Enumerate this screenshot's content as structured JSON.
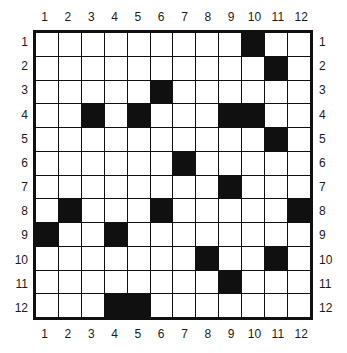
{
  "puzzle": {
    "type": "grid-puzzle",
    "rows": 12,
    "cols": 12,
    "column_labels": [
      "1",
      "2",
      "3",
      "4",
      "5",
      "6",
      "7",
      "8",
      "9",
      "10",
      "11",
      "12"
    ],
    "row_labels": [
      "1",
      "2",
      "3",
      "4",
      "5",
      "6",
      "7",
      "8",
      "9",
      "10",
      "11",
      "12"
    ],
    "colors": {
      "filled": "#101010",
      "empty": "#ffffff",
      "grid_line": "#101010",
      "label_text": "#1b1b1b"
    },
    "filled_cells": [
      {
        "row": 1,
        "col": 10
      },
      {
        "row": 2,
        "col": 11
      },
      {
        "row": 3,
        "col": 6
      },
      {
        "row": 4,
        "col": 3
      },
      {
        "row": 4,
        "col": 5
      },
      {
        "row": 4,
        "col": 9
      },
      {
        "row": 4,
        "col": 10
      },
      {
        "row": 5,
        "col": 11
      },
      {
        "row": 6,
        "col": 7
      },
      {
        "row": 7,
        "col": 9
      },
      {
        "row": 8,
        "col": 2
      },
      {
        "row": 8,
        "col": 6
      },
      {
        "row": 8,
        "col": 12
      },
      {
        "row": 9,
        "col": 1
      },
      {
        "row": 9,
        "col": 4
      },
      {
        "row": 10,
        "col": 8
      },
      {
        "row": 10,
        "col": 11
      },
      {
        "row": 11,
        "col": 9
      },
      {
        "row": 12,
        "col": 4
      },
      {
        "row": 12,
        "col": 5
      }
    ],
    "grid": [
      [
        0,
        0,
        0,
        0,
        0,
        0,
        0,
        0,
        0,
        1,
        0,
        0
      ],
      [
        0,
        0,
        0,
        0,
        0,
        0,
        0,
        0,
        0,
        0,
        1,
        0
      ],
      [
        0,
        0,
        0,
        0,
        0,
        1,
        0,
        0,
        0,
        0,
        0,
        0
      ],
      [
        0,
        0,
        1,
        0,
        1,
        0,
        0,
        0,
        1,
        1,
        0,
        0
      ],
      [
        0,
        0,
        0,
        0,
        0,
        0,
        0,
        0,
        0,
        0,
        1,
        0
      ],
      [
        0,
        0,
        0,
        0,
        0,
        0,
        1,
        0,
        0,
        0,
        0,
        0
      ],
      [
        0,
        0,
        0,
        0,
        0,
        0,
        0,
        0,
        1,
        0,
        0,
        0
      ],
      [
        0,
        1,
        0,
        0,
        0,
        1,
        0,
        0,
        0,
        0,
        0,
        1
      ],
      [
        1,
        0,
        0,
        1,
        0,
        0,
        0,
        0,
        0,
        0,
        0,
        0
      ],
      [
        0,
        0,
        0,
        0,
        0,
        0,
        0,
        1,
        0,
        0,
        1,
        0
      ],
      [
        0,
        0,
        0,
        0,
        0,
        0,
        0,
        0,
        1,
        0,
        0,
        0
      ],
      [
        0,
        0,
        0,
        1,
        1,
        0,
        0,
        0,
        0,
        0,
        0,
        0
      ]
    ]
  }
}
